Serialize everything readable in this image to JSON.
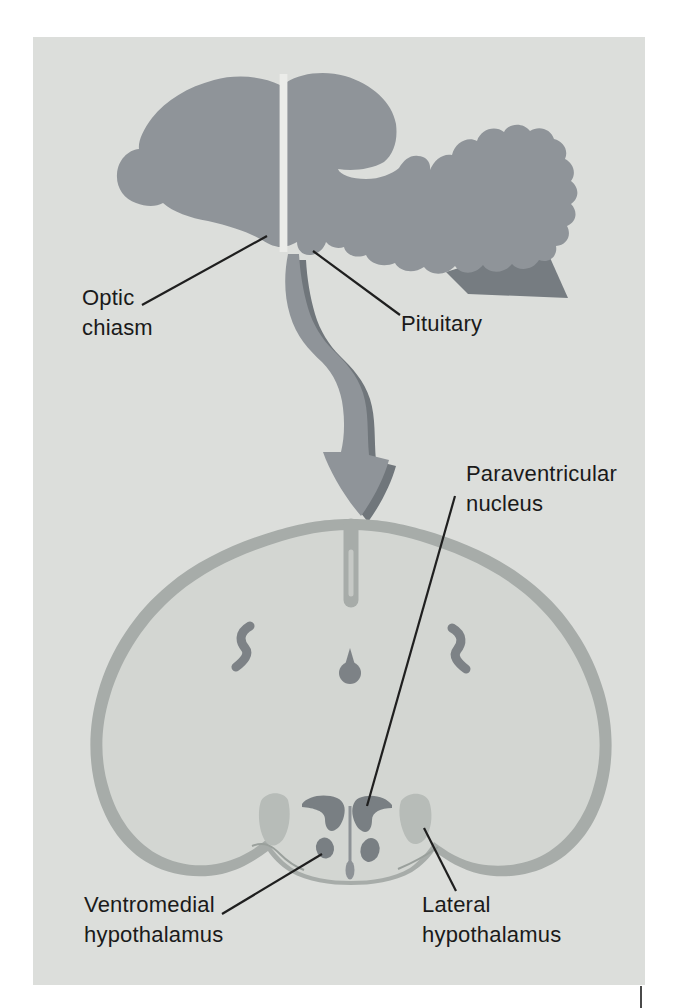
{
  "figure": {
    "labels": {
      "optic_chiasm": {
        "line1": "Optic",
        "line2": "chiasm"
      },
      "pituitary": {
        "line1": "Pituitary"
      },
      "paraventricular": {
        "line1": "Paraventricular",
        "line2": "nucleus"
      },
      "ventromedial": {
        "line1": "Ventromedial",
        "line2": "hypothalamus"
      },
      "lateral": {
        "line1": "Lateral",
        "line2": "hypothalamus"
      }
    },
    "colors": {
      "panel_bg": "#dcdedb",
      "brain_gray": "#8f9499",
      "brain_shadow": "#767c81",
      "cut_line": "#ebece9",
      "arrow_fill": "#8f9499",
      "arrow_shadow": "#70767b",
      "cortex_band": "#a7aca9",
      "section_interior": "#d3d6d2",
      "fissure_core": "#c6c9c6",
      "nucleus_dark": "#797f83",
      "nucleus_light": "#b7bcb8",
      "ventricle_gray": "#7d8286",
      "slit_gray": "#8d9296",
      "crease_gray": "#9aa09c",
      "label_text": "#1a1a1a",
      "leader_line": "#1f1f1f"
    }
  }
}
